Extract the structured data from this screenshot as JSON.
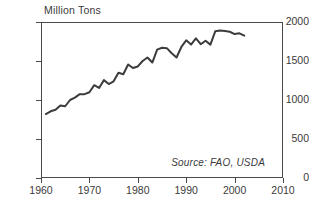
{
  "chart_data": {
    "type": "line",
    "title": "Million Tons",
    "xlabel": "",
    "ylabel": "Million Tons",
    "xlim": [
      1960,
      2010
    ],
    "ylim": [
      0,
      2000
    ],
    "xticks": [
      1960,
      1970,
      1980,
      1990,
      2000,
      2010
    ],
    "xtick_labels": [
      "1960",
      "1970",
      "1980",
      "1990",
      "2000",
      "2010"
    ],
    "yticks": [
      0,
      500,
      1000,
      1500,
      2000
    ],
    "ytick_labels": [
      "0",
      "500",
      "1000",
      "1500",
      "2000"
    ],
    "grid": false,
    "legend": null,
    "annotations": [
      {
        "name": "source-note",
        "text": "Source: FAO, USDA",
        "style": "italic",
        "position": "bottom-right-inside"
      }
    ],
    "line_color": "#3c3c3c",
    "line_width": 2,
    "series": [
      {
        "name": "World Grain Production",
        "x": [
          1961,
          1962,
          1963,
          1964,
          1965,
          1966,
          1967,
          1968,
          1969,
          1970,
          1971,
          1972,
          1973,
          1974,
          1975,
          1976,
          1977,
          1978,
          1979,
          1980,
          1981,
          1982,
          1983,
          1984,
          1985,
          1986,
          1987,
          1988,
          1989,
          1990,
          1991,
          1992,
          1993,
          1994,
          1995,
          1996,
          1997,
          1998,
          1999,
          2000,
          2001,
          2002
        ],
        "values": [
          820,
          855,
          875,
          930,
          920,
          1000,
          1030,
          1075,
          1075,
          1100,
          1190,
          1155,
          1255,
          1205,
          1240,
          1350,
          1330,
          1455,
          1410,
          1430,
          1500,
          1545,
          1480,
          1645,
          1670,
          1665,
          1600,
          1545,
          1680,
          1765,
          1710,
          1790,
          1715,
          1760,
          1710,
          1880,
          1890,
          1885,
          1875,
          1845,
          1855,
          1825
        ]
      }
    ]
  },
  "axes": {
    "y_unit_label": "Million Tons"
  }
}
